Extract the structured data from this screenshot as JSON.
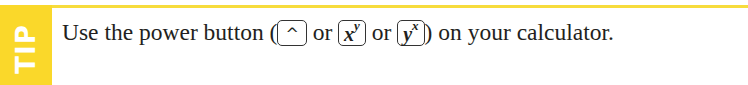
{
  "tip_box": {
    "label": "TIP",
    "accent_color": "#fad82a",
    "text": {
      "before": "Use the power button (",
      "sep1": " or ",
      "sep2": " or ",
      "after": ") on your calculator."
    },
    "keys": [
      {
        "name": "caret",
        "symbol": "^"
      },
      {
        "name": "x-power-y",
        "base": "x",
        "exponent": "y"
      },
      {
        "name": "y-power-x",
        "base": "y",
        "exponent": "x"
      }
    ]
  }
}
